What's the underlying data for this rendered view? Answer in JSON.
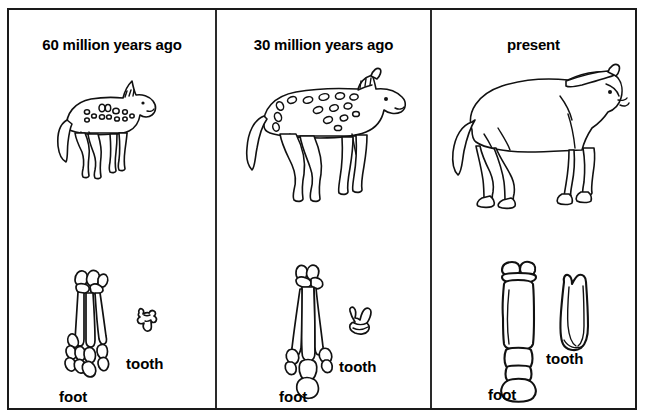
{
  "figure": {
    "title_hidden": "",
    "panels": [
      {
        "id": "panel-60mya",
        "title": "60 million years ago",
        "animal_name": "spotted-four-toed-horse-ancestor",
        "foot_label": "foot",
        "tooth_label": "tooth"
      },
      {
        "id": "panel-30mya",
        "title": "30 million years ago",
        "animal_name": "spotted-three-toed-horse-ancestor",
        "foot_label": "foot",
        "tooth_label": "tooth"
      },
      {
        "id": "panel-present",
        "title": "present",
        "animal_name": "modern-horse",
        "foot_label": "foot",
        "tooth_label": "tooth"
      }
    ]
  },
  "colors": {
    "ink": "#111111",
    "paper": "#ffffff",
    "frame": "#1a1a1a"
  }
}
